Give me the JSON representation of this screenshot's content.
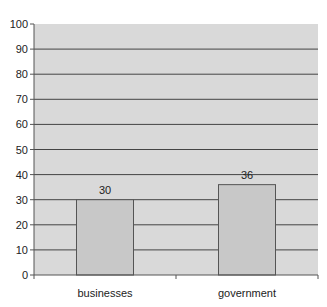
{
  "chart_data": {
    "type": "bar",
    "title": "",
    "xlabel": "",
    "ylabel": "",
    "categories": [
      "businesses",
      "government"
    ],
    "values": [
      30,
      36
    ],
    "data_labels": [
      "30",
      "36"
    ],
    "ylim": [
      0,
      100
    ],
    "yticks": [
      0,
      10,
      20,
      30,
      40,
      50,
      60,
      70,
      80,
      90,
      100
    ],
    "grid": true,
    "legend": "none",
    "colors": {
      "plot_background": "#d9d9d9",
      "bar_fill": "#c8c8c8",
      "bar_stroke": "#555555",
      "gridline": "#444444"
    }
  }
}
